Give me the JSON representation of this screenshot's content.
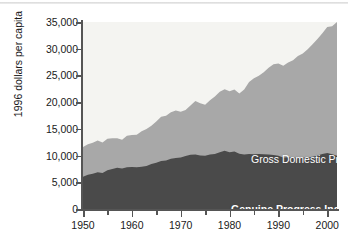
{
  "chart_data": {
    "type": "area",
    "title": "",
    "subtitle": "",
    "xlabel": "",
    "ylabel": "1996 dollars per capita",
    "xlim": [
      1950,
      2002
    ],
    "ylim": [
      0,
      35000
    ],
    "grid": false,
    "legend_position": "inline-labels",
    "stacked": false,
    "y_ticks": [
      "0",
      "5,000",
      "10,000",
      "15,000",
      "20,000",
      "25,000",
      "30,000",
      "35,000"
    ],
    "y_tick_values": [
      0,
      5000,
      10000,
      15000,
      20000,
      25000,
      30000,
      35000
    ],
    "x_ticks": [
      "1950",
      "1960",
      "1970",
      "1980",
      "1990",
      "2000"
    ],
    "x_tick_values": [
      1950,
      1960,
      1970,
      1980,
      1990,
      2000
    ],
    "x_minor_tick_values": [
      1955,
      1965,
      1975,
      1985,
      1995
    ],
    "annotations": [
      {
        "text": "Gross Domestic Product (GDP)",
        "color": "#ffffff"
      },
      {
        "text": "Genuine Progress Indicator (GPI)",
        "color": "#ffffff"
      }
    ],
    "colors": {
      "background_above": "#f4f4f1",
      "gdp_area": "#a8a8a8",
      "gpi_area": "#4a4a4a",
      "axis": "#555555",
      "text": "#1a1a1a",
      "label_text": "#ffffff"
    },
    "x": [
      1950,
      1951,
      1952,
      1953,
      1954,
      1955,
      1956,
      1957,
      1958,
      1959,
      1960,
      1961,
      1962,
      1963,
      1964,
      1965,
      1966,
      1967,
      1968,
      1969,
      1970,
      1971,
      1972,
      1973,
      1974,
      1975,
      1976,
      1977,
      1978,
      1979,
      1980,
      1981,
      1982,
      1983,
      1984,
      1985,
      1986,
      1987,
      1988,
      1989,
      1990,
      1991,
      1992,
      1993,
      1994,
      1995,
      1996,
      1997,
      1998,
      1999,
      2000,
      2001,
      2002
    ],
    "series": [
      {
        "name": "Gross Domestic Product (GDP)",
        "label": "Gross Domestic Product (GDP)",
        "color": "#a8a8a8",
        "values": [
          11600,
          12100,
          12400,
          12800,
          12450,
          13150,
          13250,
          13250,
          12950,
          13700,
          13850,
          13900,
          14550,
          14950,
          15600,
          16400,
          17250,
          17450,
          18100,
          18450,
          18200,
          18550,
          19350,
          20200,
          19800,
          19500,
          20350,
          21050,
          21950,
          22400,
          22050,
          22350,
          21600,
          22350,
          23750,
          24450,
          24950,
          25600,
          26450,
          27100,
          27250,
          26800,
          27400,
          27850,
          28650,
          29100,
          29900,
          30850,
          31800,
          32900,
          34050,
          34200,
          35000
        ]
      },
      {
        "name": "Genuine Progress Indicator (GPI)",
        "label": "Genuine Progress Indicator (GPI)",
        "color": "#4a4a4a",
        "values": [
          6050,
          6400,
          6600,
          6900,
          6750,
          7250,
          7500,
          7700,
          7600,
          7800,
          7850,
          7800,
          7900,
          8050,
          8400,
          8650,
          9000,
          9100,
          9400,
          9550,
          9650,
          9900,
          10150,
          10200,
          10000,
          9950,
          10200,
          10300,
          10600,
          10900,
          10600,
          10750,
          10350,
          10200,
          10300,
          10250,
          10300,
          10250,
          10200,
          10100,
          9950,
          9650,
          9700,
          9600,
          9700,
          9600,
          9650,
          9800,
          10000,
          10300,
          10500,
          10250,
          9950
        ]
      }
    ]
  },
  "y_axis_title": "1996 dollars per capita"
}
